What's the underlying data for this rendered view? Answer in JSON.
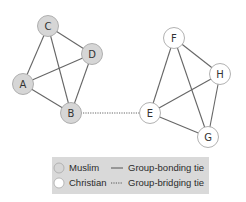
{
  "diagram": {
    "title": "",
    "colors": {
      "muslim_fill": "#d6d6d6",
      "christian_fill": "#ffffff",
      "node_stroke": "#a8a8a8",
      "edge": "#666666",
      "legend_bg": "#d9d9d9"
    },
    "nodes": [
      {
        "id": "A",
        "label": "A",
        "group": "Muslim",
        "x": 23,
        "y": 84
      },
      {
        "id": "B",
        "label": "B",
        "group": "Muslim",
        "x": 71,
        "y": 113
      },
      {
        "id": "C",
        "label": "C",
        "group": "Muslim",
        "x": 48,
        "y": 26
      },
      {
        "id": "D",
        "label": "D",
        "group": "Muslim",
        "x": 92,
        "y": 54
      },
      {
        "id": "E",
        "label": "E",
        "group": "Christian",
        "x": 150,
        "y": 113
      },
      {
        "id": "F",
        "label": "F",
        "group": "Christian",
        "x": 174,
        "y": 38
      },
      {
        "id": "G",
        "label": "G",
        "group": "Christian",
        "x": 208,
        "y": 137
      },
      {
        "id": "H",
        "label": "H",
        "group": "Christian",
        "x": 220,
        "y": 74
      }
    ],
    "edges": [
      {
        "from": "C",
        "to": "D",
        "type": "Group-bonding tie"
      },
      {
        "from": "C",
        "to": "A",
        "type": "Group-bonding tie"
      },
      {
        "from": "C",
        "to": "B",
        "type": "Group-bonding tie"
      },
      {
        "from": "A",
        "to": "D",
        "type": "Group-bonding tie"
      },
      {
        "from": "A",
        "to": "B",
        "type": "Group-bonding tie"
      },
      {
        "from": "D",
        "to": "B",
        "type": "Group-bonding tie"
      },
      {
        "from": "F",
        "to": "H",
        "type": "Group-bonding tie"
      },
      {
        "from": "F",
        "to": "E",
        "type": "Group-bonding tie"
      },
      {
        "from": "F",
        "to": "G",
        "type": "Group-bonding tie"
      },
      {
        "from": "E",
        "to": "H",
        "type": "Group-bonding tie"
      },
      {
        "from": "E",
        "to": "G",
        "type": "Group-bonding tie"
      },
      {
        "from": "H",
        "to": "G",
        "type": "Group-bonding tie"
      },
      {
        "from": "B",
        "to": "E",
        "type": "Group-bridging tie"
      }
    ],
    "legend": {
      "muslim_label": "Muslim",
      "christian_label": "Christian",
      "bonding_label": "Group-bonding tie",
      "bridging_label": "Group-bridging tie"
    }
  }
}
